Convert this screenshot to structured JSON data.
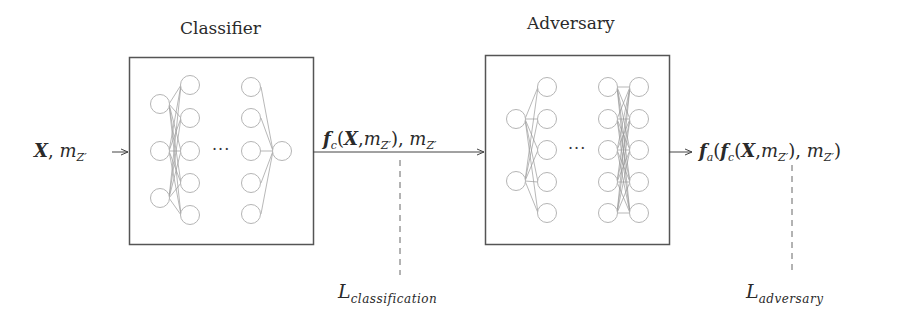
{
  "classifier": {
    "title": "Classifier",
    "ellipsis": "···",
    "layers": [
      3,
      5,
      5,
      1
    ]
  },
  "adversary": {
    "title": "Adversary",
    "ellipsis": "···",
    "layers": [
      2,
      5,
      5,
      5
    ]
  },
  "input": {
    "X": "X",
    "sep": ", ",
    "m": "m",
    "m_sub": "Z′"
  },
  "classifier_output": {
    "f": "f",
    "f_sub": "c",
    "open": "(",
    "X": "X",
    "comma": ",",
    "m": "m",
    "m_sub": "Z′",
    "close": "), ",
    "m2": "m",
    "m2_sub": "Z′"
  },
  "adversary_output": {
    "fa": "f",
    "fa_sub": "a",
    "open1": "(",
    "fc": "f",
    "fc_sub": "c",
    "open2": "(",
    "X": "X",
    "comma": ",",
    "m": "m",
    "m_sub": "Z′",
    "close1": "), ",
    "m2": "m",
    "m2_sub": "Z′",
    "close2": ")"
  },
  "losses": {
    "classification": {
      "L": "L",
      "sub": "classification"
    },
    "adversary": {
      "L": "L",
      "sub": "adversary"
    }
  },
  "colors": {
    "box_stroke": "#555555",
    "neuron_stroke": "#b5b5b5",
    "edge_stroke": "#9a9a9a",
    "arrow": "#444444",
    "text": "#2a2a2a"
  }
}
